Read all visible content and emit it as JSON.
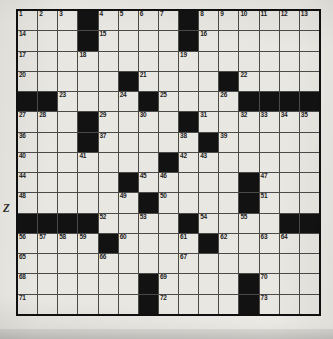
{
  "document": {
    "type": "crossword-puzzle-grid",
    "margin_text": "Z",
    "grid": {
      "rows": 15,
      "columns": 15,
      "colors": {
        "paper": "#eceae5",
        "cell_fill": "#e9e7e2",
        "block_fill": "#131212",
        "grid_line": "#4a4a48",
        "border": "#111010",
        "number_text": "#1d1d1d"
      },
      "legend": {
        "0": "white answer cell",
        "1": "black block cell"
      },
      "blocks": [
        [
          0,
          0,
          0,
          1,
          0,
          0,
          0,
          0,
          1,
          0,
          0,
          0,
          0,
          0,
          0
        ],
        [
          0,
          0,
          0,
          1,
          0,
          0,
          0,
          0,
          1,
          0,
          0,
          0,
          0,
          0,
          0
        ],
        [
          0,
          0,
          0,
          0,
          0,
          0,
          0,
          0,
          0,
          0,
          0,
          0,
          0,
          0,
          0
        ],
        [
          0,
          0,
          0,
          0,
          0,
          1,
          0,
          0,
          0,
          0,
          1,
          0,
          0,
          0,
          0
        ],
        [
          1,
          1,
          0,
          0,
          0,
          0,
          1,
          0,
          0,
          0,
          0,
          1,
          1,
          1,
          1
        ],
        [
          0,
          0,
          0,
          1,
          0,
          0,
          0,
          0,
          1,
          0,
          0,
          0,
          0,
          0,
          0
        ],
        [
          0,
          0,
          0,
          1,
          0,
          0,
          0,
          0,
          0,
          1,
          0,
          0,
          0,
          0,
          0
        ],
        [
          0,
          0,
          0,
          0,
          0,
          0,
          0,
          1,
          0,
          0,
          0,
          0,
          0,
          0,
          0
        ],
        [
          0,
          0,
          0,
          0,
          0,
          1,
          0,
          0,
          0,
          0,
          0,
          1,
          0,
          0,
          0
        ],
        [
          0,
          0,
          0,
          0,
          0,
          0,
          1,
          0,
          0,
          0,
          0,
          1,
          0,
          0,
          0
        ],
        [
          1,
          1,
          1,
          1,
          0,
          0,
          0,
          0,
          1,
          0,
          0,
          0,
          0,
          1,
          1
        ],
        [
          0,
          0,
          0,
          0,
          1,
          0,
          0,
          0,
          0,
          1,
          0,
          0,
          0,
          0,
          0
        ],
        [
          0,
          0,
          0,
          0,
          0,
          0,
          0,
          0,
          0,
          0,
          0,
          0,
          0,
          0,
          0
        ],
        [
          0,
          0,
          0,
          0,
          0,
          0,
          1,
          0,
          0,
          0,
          0,
          1,
          0,
          0,
          0
        ],
        [
          0,
          0,
          0,
          0,
          0,
          0,
          1,
          0,
          0,
          0,
          0,
          1,
          0,
          0,
          0
        ]
      ],
      "numbers": [
        [
          1,
          2,
          3,
          null,
          4,
          5,
          6,
          7,
          null,
          8,
          9,
          10,
          11,
          12,
          13
        ],
        [
          14,
          null,
          null,
          null,
          15,
          null,
          null,
          null,
          null,
          16,
          null,
          null,
          null,
          null,
          null
        ],
        [
          17,
          null,
          null,
          18,
          null,
          null,
          null,
          null,
          19,
          null,
          null,
          null,
          null,
          null,
          null
        ],
        [
          20,
          null,
          null,
          null,
          null,
          null,
          21,
          null,
          null,
          null,
          null,
          22,
          null,
          null,
          null
        ],
        [
          null,
          null,
          23,
          null,
          null,
          24,
          null,
          25,
          null,
          null,
          26,
          null,
          null,
          null,
          null
        ],
        [
          27,
          28,
          null,
          null,
          29,
          null,
          30,
          null,
          null,
          31,
          null,
          32,
          33,
          34,
          35
        ],
        [
          36,
          null,
          null,
          null,
          37,
          null,
          null,
          null,
          38,
          null,
          39,
          null,
          null,
          null,
          null
        ],
        [
          40,
          null,
          null,
          41,
          null,
          null,
          null,
          null,
          42,
          43,
          null,
          null,
          null,
          null,
          null
        ],
        [
          44,
          null,
          null,
          null,
          null,
          null,
          45,
          46,
          null,
          null,
          null,
          null,
          47,
          null,
          null
        ],
        [
          48,
          null,
          null,
          null,
          null,
          49,
          null,
          50,
          null,
          null,
          null,
          null,
          51,
          null,
          null
        ],
        [
          null,
          null,
          null,
          null,
          52,
          null,
          53,
          null,
          null,
          54,
          null,
          55,
          null,
          null,
          null
        ],
        [
          56,
          57,
          58,
          59,
          null,
          60,
          null,
          null,
          61,
          null,
          62,
          null,
          63,
          64,
          null
        ],
        [
          65,
          null,
          null,
          null,
          66,
          null,
          null,
          null,
          67,
          null,
          null,
          null,
          null,
          null,
          null
        ],
        [
          68,
          null,
          null,
          null,
          null,
          null,
          null,
          69,
          null,
          null,
          null,
          null,
          70,
          null,
          null
        ],
        [
          71,
          null,
          null,
          null,
          null,
          null,
          null,
          72,
          null,
          null,
          null,
          null,
          73,
          null,
          null
        ]
      ],
      "letters": [
        [
          "",
          "",
          "",
          "",
          "",
          "",
          "",
          "",
          "",
          "",
          "",
          "",
          "",
          "",
          ""
        ],
        [
          "",
          "",
          "",
          "",
          "",
          "",
          "",
          "",
          "",
          "",
          "",
          "",
          "",
          "",
          ""
        ],
        [
          "",
          "",
          "",
          "",
          "",
          "",
          "",
          "",
          "",
          "",
          "",
          "",
          "",
          "",
          ""
        ],
        [
          "",
          "",
          "",
          "",
          "",
          "",
          "",
          "",
          "",
          "",
          "",
          "",
          "",
          "",
          ""
        ],
        [
          "",
          "",
          "",
          "",
          "",
          "",
          "",
          "",
          "",
          "",
          "",
          "",
          "",
          "",
          ""
        ],
        [
          "",
          "",
          "",
          "",
          "",
          "",
          "",
          "",
          "",
          "",
          "",
          "",
          "",
          "",
          ""
        ],
        [
          "",
          "",
          "",
          "",
          "",
          "",
          "",
          "",
          "",
          "",
          "",
          "",
          "",
          "",
          ""
        ],
        [
          "",
          "",
          "",
          "",
          "",
          "",
          "",
          "",
          "",
          "",
          "",
          "",
          "",
          "",
          ""
        ],
        [
          "",
          "",
          "",
          "",
          "",
          "",
          "",
          "",
          "",
          "",
          "",
          "",
          "",
          "",
          ""
        ],
        [
          "",
          "",
          "",
          "",
          "",
          "",
          "",
          "",
          "",
          "",
          "",
          "",
          "",
          "",
          ""
        ],
        [
          "",
          "",
          "",
          "",
          "",
          "",
          "",
          "",
          "",
          "",
          "",
          "",
          "",
          "",
          ""
        ],
        [
          "",
          "",
          "",
          "",
          "",
          "",
          "",
          "",
          "",
          "",
          "",
          "",
          "",
          "",
          ""
        ],
        [
          "",
          "",
          "",
          "",
          "",
          "",
          "",
          "",
          "",
          "",
          "",
          "",
          "",
          "",
          ""
        ],
        [
          "",
          "",
          "",
          "",
          "",
          "",
          "",
          "",
          "",
          "",
          "",
          "",
          "",
          "",
          ""
        ],
        [
          "",
          "",
          "",
          "",
          "",
          "",
          "",
          "",
          "",
          "",
          "",
          "",
          "",
          "",
          ""
        ]
      ]
    }
  }
}
